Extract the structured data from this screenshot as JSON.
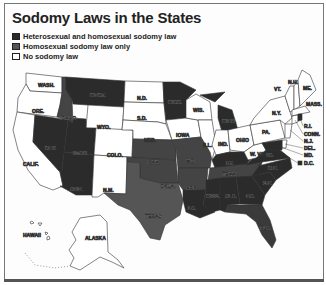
{
  "title": "Sodomy Laws in the States",
  "legend": {
    "items": [
      {
        "label": "Heterosexual and homosexual sodomy law",
        "color": "#2a2a2a"
      },
      {
        "label": "Homosexual sodomy law only",
        "color": "#555555"
      },
      {
        "label": "No sodomy law",
        "color": "#ffffff"
      }
    ]
  },
  "colors": {
    "both": "#2b2b2b",
    "homosexual_only": "#565656",
    "none": "#ffffff",
    "border": "#333333"
  },
  "states": {
    "wash": "WASH.",
    "ore": "ORE.",
    "calif": "CALIF.",
    "nev": "NEV.",
    "idaho": "IDAHO",
    "mont": "MONT.",
    "wyo": "WYO.",
    "utah": "UTAH",
    "ariz": "ARIZ.",
    "colo": "COLO.",
    "nm": "N.M.",
    "nd": "N.D.",
    "sd": "S.D.",
    "neb": "NEB.",
    "kan": "KAN.",
    "okla": "OKLA.",
    "texas": "TEXAS",
    "minn": "MINN.",
    "iowa": "IOWA",
    "mo": "MO.",
    "ark": "ARK.",
    "la": "LA.",
    "wis": "WIS.",
    "ill": "ILL.",
    "mich": "MICH.",
    "ind": "IND.",
    "ohio": "OHIO",
    "ky": "KY.",
    "tenn": "TENN.",
    "miss": "MISS.",
    "ala": "ALA.",
    "ga": "GA.",
    "fla": "FLA.",
    "sc": "S.C.",
    "nc": "N.C.",
    "va": "VA.",
    "wva": "W. VA.",
    "pa": "PA.",
    "ny": "N.Y.",
    "vt": "VT.",
    "nh": "N.H.",
    "me": "ME.",
    "mass": "MASS.",
    "ri": "R.I.",
    "conn": "CONN.",
    "nj": "N.J.",
    "del": "DEL.",
    "md": "MD.",
    "dc": "D.C.",
    "hawaii": "HAWAII",
    "alaska": "ALASKA"
  },
  "map_data": {
    "both": [
      "MONT.",
      "IDAHO",
      "UTAH",
      "ARIZ.",
      "NEV.",
      "MINN.",
      "MICH.",
      "KAN.",
      "OKLA.",
      "MO.",
      "ARK.",
      "LA.",
      "KY.",
      "TENN.",
      "MISS.",
      "ALA.",
      "GA.",
      "FLA.",
      "S.C.",
      "N.C.",
      "VA.",
      "MD.",
      "D.C.",
      "TEXAS",
      "R.I."
    ],
    "homosexual_only": [
      "TEXAS",
      "KAN.",
      "MO.",
      "ARK.",
      "TENN.",
      "OKLA."
    ],
    "none": [
      "WASH.",
      "ORE.",
      "CALIF.",
      "WYO.",
      "COLO.",
      "N.M.",
      "N.D.",
      "S.D.",
      "NEB.",
      "IOWA",
      "WIS.",
      "ILL.",
      "IND.",
      "OHIO",
      "W. VA.",
      "PA.",
      "N.Y.",
      "VT.",
      "N.H.",
      "ME.",
      "MASS.",
      "CONN.",
      "N.J.",
      "DEL.",
      "HAWAII",
      "ALASKA"
    ]
  }
}
